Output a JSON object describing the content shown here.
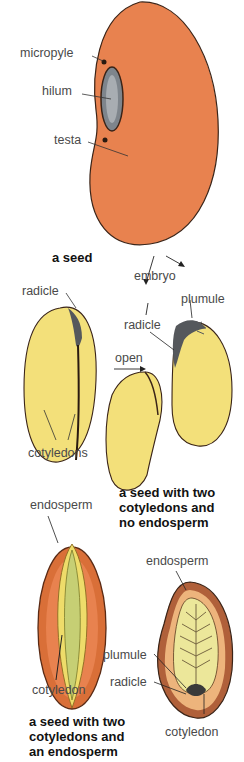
{
  "diagram": {
    "seed": {
      "labels": {
        "micropyle": "micropyle",
        "hilum": "hilum",
        "testa": "testa"
      },
      "caption": "a seed",
      "colors": {
        "testa": "#e8824f",
        "hilum": "#8a9096",
        "outline": "#3a2418"
      }
    },
    "dicot_no_endosperm": {
      "labels": {
        "radicle_left": "radicle",
        "cotyledons": "cotyledons",
        "embryo": "embryo",
        "plumule": "plumule",
        "radicle_right": "radicle",
        "open": "open"
      },
      "caption": [
        "a seed with two",
        "cotyledons and",
        "no endosperm"
      ],
      "colors": {
        "cotyledon": "#f3e07a",
        "embryo": "#55585c"
      }
    },
    "dicot_endosperm": {
      "labels": {
        "endosperm": "endosperm",
        "cotyledon": "cotyledon"
      },
      "caption": [
        "a seed with two",
        "cotyledons and",
        "an endosperm"
      ],
      "colors": {
        "outer": "#e07a3c",
        "cotyledon": "#eedc6a",
        "center": "#c6cf74"
      }
    },
    "monocot_like": {
      "labels": {
        "endosperm": "endosperm",
        "plumule": "plumule",
        "radicle": "radicle",
        "cotyledon": "cotyledon"
      },
      "colors": {
        "coat": "#b0603a",
        "endosperm": "#edb47c",
        "cotyledon": "#ece79a",
        "veins": "#6b5a3a"
      }
    }
  }
}
